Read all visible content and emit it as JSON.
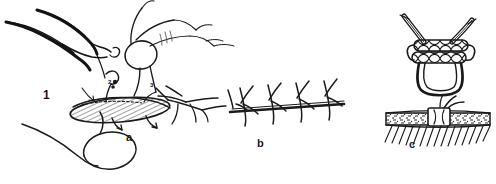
{
  "figure": {
    "kind": "line-drawing",
    "background_color": "#ffffff",
    "ink_color": "#1a1a1a",
    "width": 496,
    "height": 184,
    "panels": [
      {
        "id": "a",
        "label": "a",
        "caption": "",
        "description": "needle holder and tissue forceps placing an interrupted suture through the edges of an elliptical wound",
        "callouts": [
          {
            "id": "1",
            "label": "1",
            "target": "needle-holder"
          },
          {
            "id": "2",
            "label": "2",
            "target": "needle-entry-point"
          },
          {
            "id": "3",
            "label": "3",
            "target": "tissue-forceps"
          }
        ]
      },
      {
        "id": "b",
        "label": "b",
        "caption": "",
        "description": "continuous running suture line along a closed wound",
        "stitch_count": 4
      },
      {
        "id": "c",
        "label": "c",
        "caption": "",
        "description": "surgeon's double-throw knot above a closed, hatched incision secured with a single knot",
        "knot_throws": 2
      }
    ],
    "elements": {
      "needle_holder_label": "needle holder",
      "forceps_label": "tissue forceps",
      "suture_thread_label": "suture thread",
      "wound_label": "wound edges",
      "knot_label": "surgeon's knot",
      "hatching_label": "tissue hatching"
    }
  }
}
